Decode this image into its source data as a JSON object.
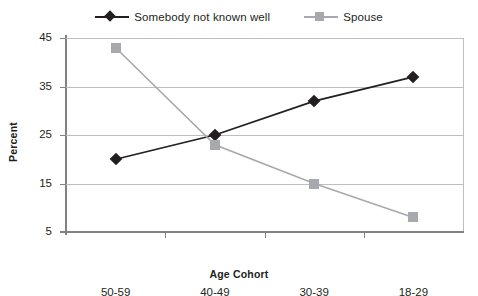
{
  "chart_data": {
    "type": "line",
    "title": "",
    "xlabel": "Age Cohort",
    "ylabel": "Percent",
    "categories": [
      "50-59",
      "40-49",
      "30-39",
      "18-29"
    ],
    "series": [
      {
        "name": "Somebody not known well",
        "values": [
          20,
          25,
          32,
          37
        ],
        "color": "#231f20",
        "marker": "diamond"
      },
      {
        "name": "Spouse",
        "values": [
          43,
          23,
          15,
          8
        ],
        "color": "#a7a9ac",
        "marker": "square"
      }
    ],
    "ylim": [
      5,
      45
    ],
    "yticks": [
      5,
      15,
      25,
      35,
      45
    ],
    "ytick_labels": [
      "5",
      "15",
      "25",
      "35",
      "45"
    ],
    "grid": true,
    "legend_position": "top"
  },
  "legend": {
    "entries": [
      {
        "label": "Somebody not known well"
      },
      {
        "label": "Spouse"
      }
    ]
  },
  "axes": {
    "y_title": "Percent",
    "x_title": "Age Cohort"
  },
  "colors": {
    "series_dark": "#231f20",
    "series_grey": "#a7a9ac",
    "gridline": "#bcbec0",
    "axis": "#808285",
    "background": "#ffffff"
  }
}
